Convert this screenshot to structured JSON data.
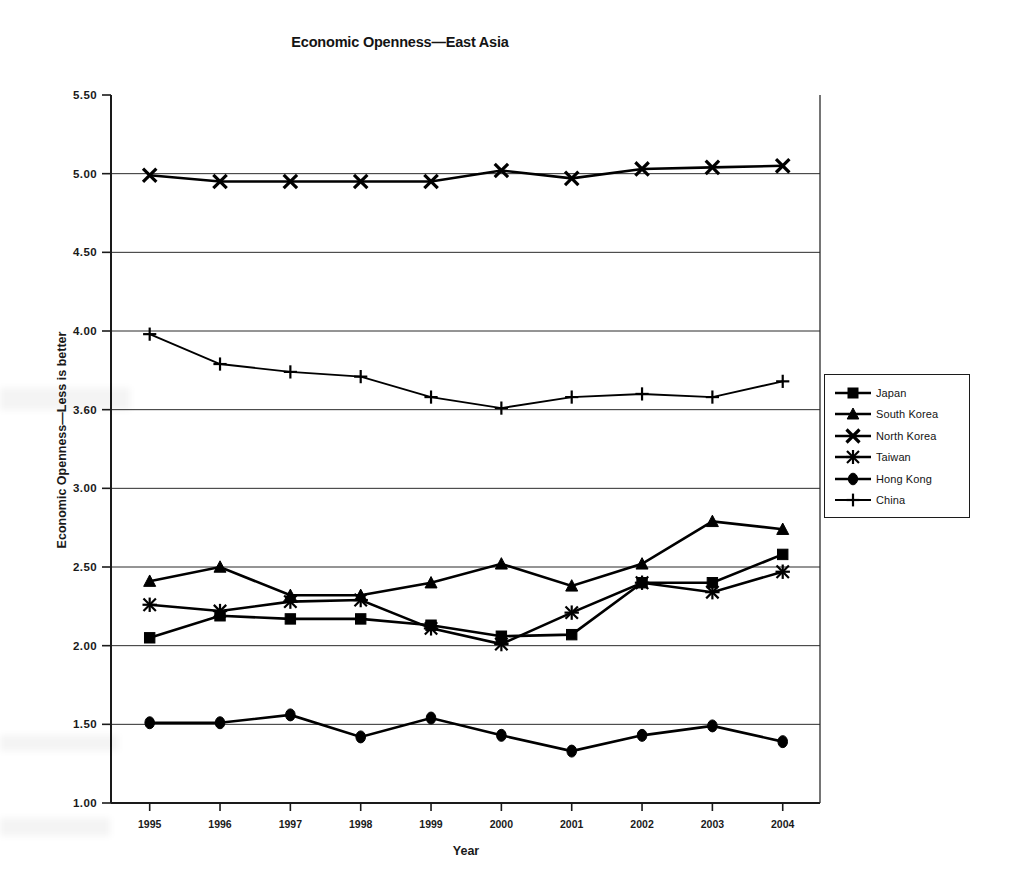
{
  "chart_data": {
    "type": "line",
    "title": "Economic Openness—East Asia",
    "xlabel": "Year",
    "ylabel": "Economic Openness—Less is better",
    "categories": [
      "1995",
      "1996",
      "1997",
      "1998",
      "1999",
      "2000",
      "2001",
      "2002",
      "2003",
      "2004"
    ],
    "x": [
      1995,
      1996,
      1997,
      1998,
      1999,
      2000,
      2001,
      2002,
      2003,
      2004
    ],
    "ylim": [
      1.0,
      5.5
    ],
    "ytick_labels": [
      "1.00",
      "1.50",
      "2.00",
      "2.50",
      "3.00",
      "3.60",
      "4.00",
      "4.50",
      "5.00",
      "5.50"
    ],
    "ytick_values": [
      1.0,
      1.5,
      2.0,
      2.5,
      3.0,
      3.5,
      4.0,
      4.5,
      5.0,
      5.5
    ],
    "grid": true,
    "legend_position": "right-outside",
    "series": [
      {
        "name": "Japan",
        "marker": "square",
        "values": [
          2.05,
          2.19,
          2.17,
          2.17,
          2.13,
          2.06,
          2.07,
          2.4,
          2.4,
          2.58
        ]
      },
      {
        "name": "South Korea",
        "marker": "triangle",
        "values": [
          2.41,
          2.5,
          2.32,
          2.32,
          2.4,
          2.52,
          2.38,
          2.52,
          2.79,
          2.74
        ]
      },
      {
        "name": "North Korea",
        "marker": "x",
        "values": [
          4.99,
          4.95,
          4.95,
          4.95,
          4.95,
          5.02,
          4.97,
          5.03,
          5.04,
          5.05
        ]
      },
      {
        "name": "Taiwan",
        "marker": "star",
        "values": [
          2.26,
          2.22,
          2.28,
          2.29,
          2.11,
          2.01,
          2.21,
          2.4,
          2.34,
          2.47
        ]
      },
      {
        "name": "Hong Kong",
        "marker": "circle",
        "values": [
          1.51,
          1.51,
          1.56,
          1.42,
          1.54,
          1.43,
          1.33,
          1.43,
          1.49,
          1.39
        ]
      },
      {
        "name": "China",
        "marker": "plus",
        "values": [
          3.98,
          3.79,
          3.74,
          3.71,
          3.58,
          3.51,
          3.58,
          3.6,
          3.58,
          3.68
        ]
      }
    ]
  },
  "legend": {
    "items": [
      {
        "label": "Japan",
        "marker": "square"
      },
      {
        "label": "South Korea",
        "marker": "triangle"
      },
      {
        "label": "North Korea",
        "marker": "x"
      },
      {
        "label": "Taiwan",
        "marker": "star"
      },
      {
        "label": "Hong Kong",
        "marker": "circle"
      },
      {
        "label": "China",
        "marker": "plus"
      }
    ]
  },
  "colors": {
    "ink": "#000000",
    "grid": "#2b2b2b",
    "background": "#ffffff"
  }
}
